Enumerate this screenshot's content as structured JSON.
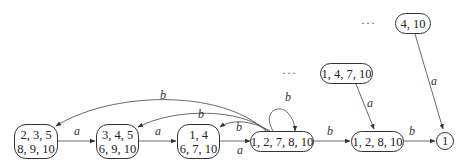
{
  "diagram": {
    "type": "automaton",
    "nodes": [
      {
        "id": "n1",
        "line1": "2, 3, 5",
        "line2": "8, 9, 10"
      },
      {
        "id": "n2",
        "line1": "3, 4, 5",
        "line2": "6, 9, 10"
      },
      {
        "id": "n3",
        "line1": "1, 4",
        "line2": "6, 7, 10"
      },
      {
        "id": "n4",
        "line1": "1, 2, 7, 8, 10"
      },
      {
        "id": "n5",
        "line1": "1, 2, 8, 10"
      },
      {
        "id": "n6",
        "line1": "1"
      },
      {
        "id": "n7",
        "line1": "1, 4, 7, 10"
      },
      {
        "id": "n8",
        "line1": "4, 10"
      }
    ],
    "edges": [
      {
        "from": "n1",
        "to": "n2",
        "label": "a"
      },
      {
        "from": "n2",
        "to": "n3",
        "label": "a"
      },
      {
        "from": "n3",
        "to": "n4",
        "label": "a"
      },
      {
        "from": "n4",
        "to": "n5",
        "label": "b"
      },
      {
        "from": "n5",
        "to": "n6",
        "label": "b"
      },
      {
        "from": "n4",
        "to": "n4",
        "label": "b"
      },
      {
        "from": "n4",
        "to": "n3",
        "label": "b"
      },
      {
        "from": "n4",
        "to": "n2",
        "label": "b"
      },
      {
        "from": "n4",
        "to": "n1",
        "label": "b"
      },
      {
        "from": "n7",
        "to": "n5",
        "label": "a"
      },
      {
        "from": "n8",
        "to": "n6",
        "label": "a"
      }
    ],
    "ellipses": [
      "···",
      "···"
    ]
  }
}
